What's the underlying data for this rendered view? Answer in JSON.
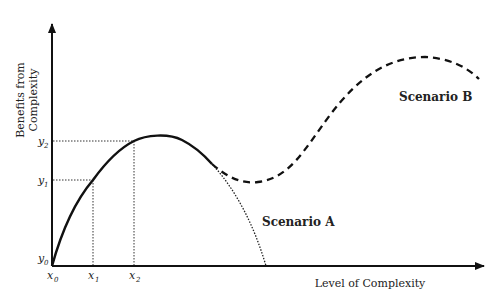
{
  "diagram": {
    "type": "conceptual-curve",
    "y_axis_label_line1": "Benefits from",
    "y_axis_label_line2": "Complexity",
    "x_axis_label": "Level of Complexity",
    "y_ticks": [
      {
        "base": "y",
        "sub": "0"
      },
      {
        "base": "y",
        "sub": "1"
      },
      {
        "base": "y",
        "sub": "2"
      }
    ],
    "x_ticks": [
      {
        "base": "x",
        "sub": "0"
      },
      {
        "base": "x",
        "sub": "1"
      },
      {
        "base": "x",
        "sub": "2"
      }
    ],
    "scenarios": [
      {
        "label": "Scenario A",
        "style": "dotted",
        "description": "benefits decline to zero after peak"
      },
      {
        "label": "Scenario B",
        "style": "dashed",
        "description": "benefits dip then rise to a new higher peak"
      }
    ],
    "main_curve_style": "solid",
    "colors": {
      "line": "#111111",
      "text": "#222222",
      "background": "#ffffff"
    }
  }
}
